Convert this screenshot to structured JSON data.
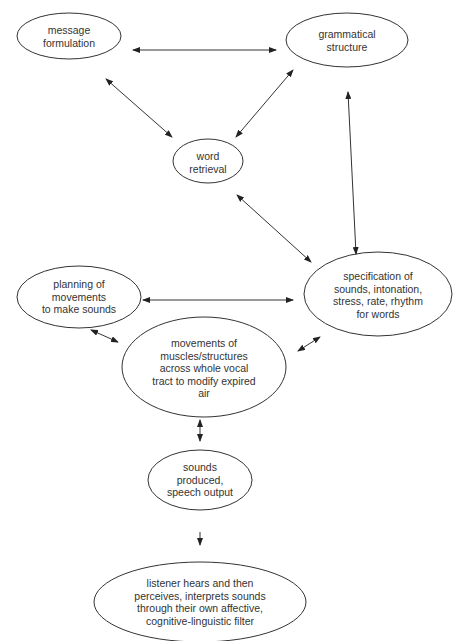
{
  "diagram": {
    "type": "flow",
    "nodes": [
      {
        "id": "message",
        "lines": [
          "message",
          "formulation"
        ]
      },
      {
        "id": "grammar",
        "lines": [
          "grammatical",
          "structure"
        ]
      },
      {
        "id": "word",
        "lines": [
          "word",
          "retrieval"
        ]
      },
      {
        "id": "spec",
        "lines": [
          "specification of",
          "sounds, intonation,",
          "stress, rate, rhythm",
          "for words"
        ]
      },
      {
        "id": "planning",
        "lines": [
          "planning of",
          "movements",
          "to make sounds"
        ]
      },
      {
        "id": "movements",
        "lines": [
          "movements of",
          "muscles/structures",
          "across whole vocal",
          "tract to modify expired",
          "air"
        ]
      },
      {
        "id": "sounds",
        "lines": [
          "sounds",
          "produced,",
          "speech output"
        ]
      },
      {
        "id": "listener",
        "lines": [
          "listener hears and then",
          "perceives, interprets sounds",
          "through their own affective,",
          "cognitive-linguistic filter"
        ]
      }
    ],
    "edges": [
      {
        "from": "message",
        "to": "grammar",
        "direction": "both"
      },
      {
        "from": "message",
        "to": "word",
        "direction": "both"
      },
      {
        "from": "grammar",
        "to": "word",
        "direction": "both"
      },
      {
        "from": "grammar",
        "to": "spec",
        "direction": "both"
      },
      {
        "from": "word",
        "to": "spec",
        "direction": "both"
      },
      {
        "from": "planning",
        "to": "spec",
        "direction": "both"
      },
      {
        "from": "planning",
        "to": "movements",
        "direction": "both"
      },
      {
        "from": "spec",
        "to": "movements",
        "direction": "both"
      },
      {
        "from": "movements",
        "to": "sounds",
        "direction": "both"
      },
      {
        "from": "sounds",
        "to": "listener",
        "direction": "forward"
      }
    ]
  }
}
